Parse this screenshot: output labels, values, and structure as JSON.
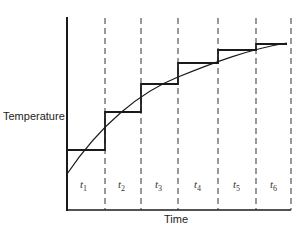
{
  "diagram": {
    "y_axis_label": "Temperature",
    "x_axis_label": "Time",
    "intervals": [
      {
        "label": "t",
        "sub": "1"
      },
      {
        "label": "t",
        "sub": "2"
      },
      {
        "label": "t",
        "sub": "3"
      },
      {
        "label": "t",
        "sub": "4"
      },
      {
        "label": "t",
        "sub": "5"
      },
      {
        "label": "t",
        "sub": "6"
      }
    ],
    "colors": {
      "line": "#1a1a1a",
      "background": "#ffffff"
    }
  }
}
